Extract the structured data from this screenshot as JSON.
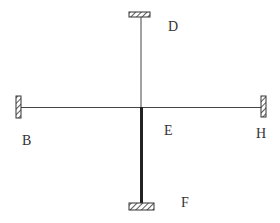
{
  "diagram": {
    "type": "structural-frame",
    "colors": {
      "line": "#444444",
      "thick_line": "#222222",
      "support_stroke": "#333333",
      "label": "#333333",
      "background": "#ffffff"
    },
    "nodes": [
      {
        "id": "D",
        "label": "D",
        "role": "top fixed support"
      },
      {
        "id": "B",
        "label": "B",
        "role": "left fixed support"
      },
      {
        "id": "E",
        "label": "E",
        "role": "central joint"
      },
      {
        "id": "H",
        "label": "H",
        "role": "right fixed support"
      },
      {
        "id": "F",
        "label": "F",
        "role": "bottom fixed support"
      }
    ],
    "members": [
      {
        "from": "D",
        "to": "E",
        "weight": "thin"
      },
      {
        "from": "B",
        "to": "E",
        "weight": "thin"
      },
      {
        "from": "E",
        "to": "H",
        "weight": "thin"
      },
      {
        "from": "E",
        "to": "F",
        "weight": "thick"
      }
    ],
    "labels": {
      "D": "D",
      "B": "B",
      "E": "E",
      "H": "H",
      "F": "F"
    }
  }
}
